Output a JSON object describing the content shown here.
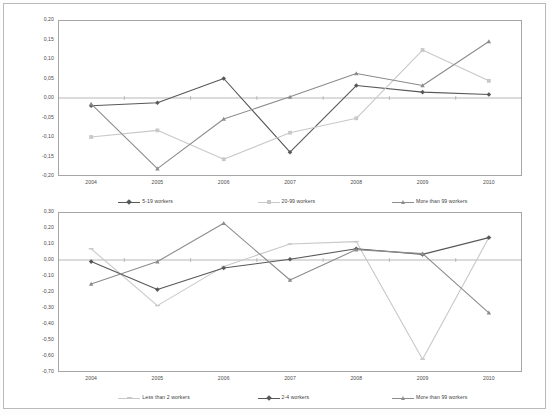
{
  "figure": {
    "background": "#ffffff",
    "frame_color": "#b9b9b9"
  },
  "colors": {
    "series_dark": "#585858",
    "series_light": "#c8c8c8",
    "series_mid": "#8c8c8c",
    "axis": "#a6a6a6",
    "text": "#4a4a4a",
    "zero_line": "#9a9a9a"
  },
  "chart_data": [
    {
      "id": "top",
      "type": "line",
      "title": "",
      "xlabel": "",
      "ylabel": "",
      "categories": [
        "2004",
        "2005",
        "2006",
        "2007",
        "2008",
        "2009",
        "2010"
      ],
      "x": [
        2004,
        2005,
        2006,
        2007,
        2008,
        2009,
        2010
      ],
      "ylim": [
        -0.2,
        0.2
      ],
      "yticks": [
        0.2,
        0.15,
        0.1,
        0.05,
        0.0,
        -0.05,
        -0.1,
        -0.15,
        -0.2
      ],
      "ytick_labels": [
        "0,20",
        "0,15",
        "0,10",
        "0,05",
        "0,00",
        "-0,05",
        "-0,10",
        "-0,15",
        "-0,20"
      ],
      "grid": false,
      "legend_position": "bottom",
      "series": [
        {
          "name": "5-19 workers",
          "color": "#585858",
          "marker": "diamond",
          "values": [
            -0.02,
            -0.012,
            0.05,
            -0.139,
            0.032,
            0.015,
            0.009
          ]
        },
        {
          "name": "20-99 workers",
          "color": "#c8c8c8",
          "marker": "square",
          "values": [
            -0.1,
            -0.083,
            -0.157,
            -0.089,
            -0.052,
            0.123,
            0.044
          ]
        },
        {
          "name": "More than 99 workers",
          "color": "#8c8c8c",
          "marker": "triangle",
          "values": [
            -0.015,
            -0.181,
            -0.054,
            0.003,
            0.063,
            0.032,
            0.145
          ]
        }
      ]
    },
    {
      "id": "bottom",
      "type": "line",
      "title": "",
      "xlabel": "",
      "ylabel": "",
      "categories": [
        "2004",
        "2005",
        "2006",
        "2007",
        "2008",
        "2009",
        "2010"
      ],
      "x": [
        2004,
        2005,
        2006,
        2007,
        2008,
        2009,
        2010
      ],
      "ylim": [
        -0.7,
        0.3
      ],
      "yticks": [
        0.3,
        0.2,
        0.1,
        0.0,
        -0.1,
        -0.2,
        -0.3,
        -0.4,
        -0.5,
        -0.6,
        -0.7
      ],
      "ytick_labels": [
        "0,30",
        "0,20",
        "0,10",
        "0,00",
        "-0,10",
        "-0,20",
        "-0,30",
        "-0,40",
        "-0,50",
        "-0,60",
        "-0,70"
      ],
      "grid": false,
      "legend_position": "bottom",
      "series": [
        {
          "name": "Less than 2 workers",
          "color": "#c8c8c8",
          "marker": "dash",
          "values": [
            0.07,
            -0.285,
            -0.04,
            0.1,
            0.115,
            -0.62,
            0.14
          ]
        },
        {
          "name": "2-4 workers",
          "color": "#585858",
          "marker": "diamond",
          "values": [
            -0.01,
            -0.185,
            -0.05,
            0.005,
            0.07,
            0.035,
            0.14
          ]
        },
        {
          "name": "More than 99 workers",
          "color": "#8c8c8c",
          "marker": "triangle",
          "values": [
            -0.15,
            -0.01,
            0.23,
            -0.125,
            0.065,
            0.04,
            -0.33
          ]
        }
      ]
    }
  ]
}
